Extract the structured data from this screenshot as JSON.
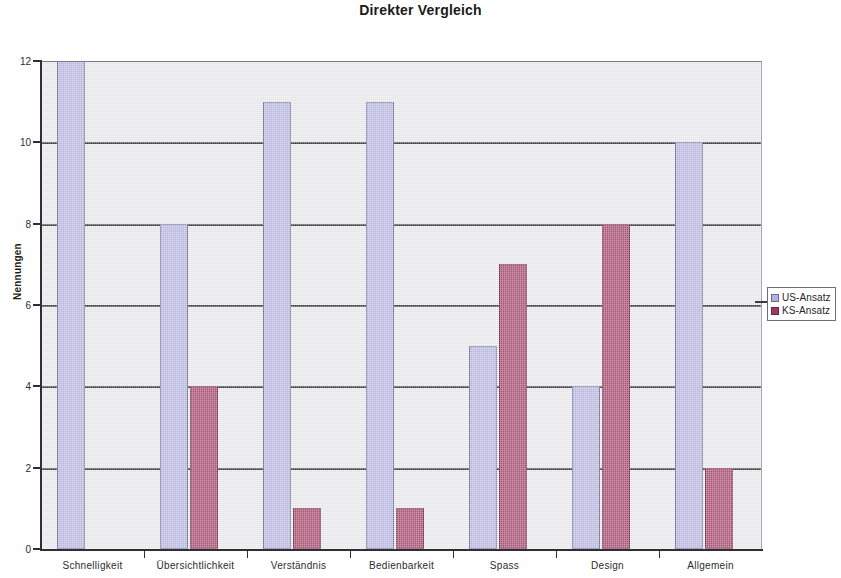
{
  "chart_data": {
    "type": "bar",
    "title": "Direkter Vergleich",
    "xlabel": "",
    "ylabel": "Nennungen",
    "categories": [
      "Schnelligkeit",
      "Übersichtlichkeit",
      "Verständnis",
      "Bedienbarkeit",
      "Spass",
      "Design",
      "Allgemein"
    ],
    "series": [
      {
        "name": "US-Ansatz",
        "color": "#b2b2e0",
        "values": [
          12,
          8,
          11,
          11,
          5,
          4,
          10
        ]
      },
      {
        "name": "KS-Ansatz",
        "color": "#9e3a60",
        "values": [
          0,
          4,
          1,
          1,
          7,
          8,
          2
        ]
      }
    ],
    "ylim": [
      0,
      12
    ],
    "ytick_step": 2,
    "ytick_labels": [
      "0",
      "2",
      "4",
      "6",
      "8",
      "10",
      "12"
    ],
    "grid": true,
    "grid_axis": "y",
    "legend_position": "right",
    "plot_background": "#e9e9ec",
    "figure_background": "#ffffff",
    "axis_color": "#2e2e34",
    "gridline_color": "#3a3a40"
  }
}
